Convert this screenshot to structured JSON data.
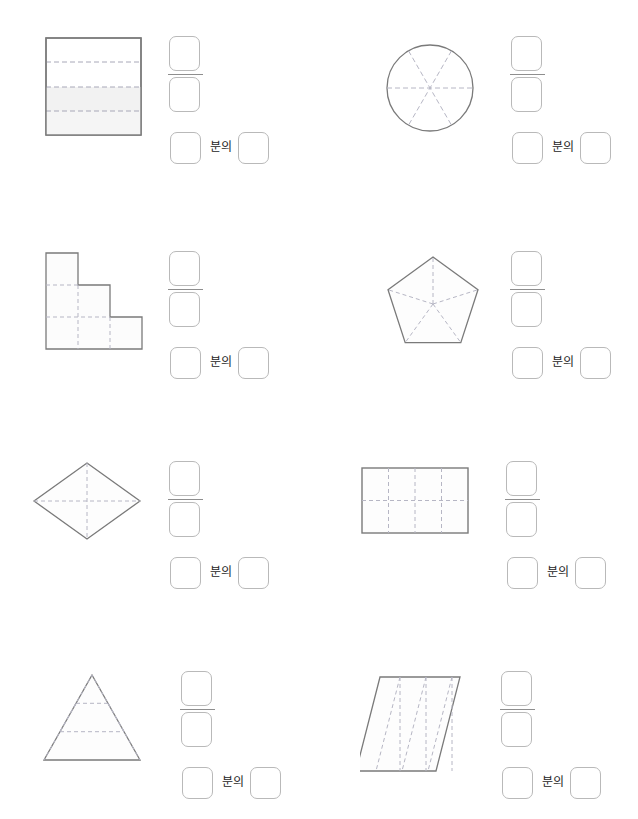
{
  "page": {
    "background": "#ffffff",
    "width": 638,
    "height": 819,
    "stroke_color": "#7a7a7a",
    "dash_color": "#b0b0b0",
    "box_border_color": "#b9b9b9",
    "shade_color": "#f2f2f2"
  },
  "labels": {
    "bunui": "분의"
  },
  "problems": [
    {
      "id": "p1",
      "index": 1,
      "figure": {
        "name": "rectangle-horizontal-strips",
        "shape": "rectangle",
        "total_parts": 4,
        "shaded_parts": 2,
        "division": "horizontal strips",
        "shaded_indices": [
          3,
          4
        ]
      },
      "answer": {
        "numerator": "",
        "denominator": "",
        "words_left": "",
        "words_right": "",
        "separator": "분의"
      }
    },
    {
      "id": "p2",
      "index": 2,
      "figure": {
        "name": "circle-six-sectors",
        "shape": "circle",
        "total_parts": 6,
        "shaded_parts": 0,
        "division": "three diameters",
        "shaded_indices": []
      },
      "answer": {
        "numerator": "",
        "denominator": "",
        "words_left": "",
        "words_right": "",
        "separator": "분의"
      }
    },
    {
      "id": "p3",
      "index": 3,
      "figure": {
        "name": "staircase-six-squares",
        "shape": "staircase polyomino",
        "total_parts": 6,
        "shaded_parts": 0,
        "division": "unit squares grid",
        "shaded_indices": []
      },
      "answer": {
        "numerator": "",
        "denominator": "",
        "words_left": "",
        "words_right": "",
        "separator": "분의"
      }
    },
    {
      "id": "p4",
      "index": 4,
      "figure": {
        "name": "pentagon-five-triangles",
        "shape": "pentagon",
        "total_parts": 5,
        "shaded_parts": 0,
        "division": "radii from center",
        "shaded_indices": []
      },
      "answer": {
        "numerator": "",
        "denominator": "",
        "words_left": "",
        "words_right": "",
        "separator": "분의"
      }
    },
    {
      "id": "p5",
      "index": 5,
      "figure": {
        "name": "rhombus-four-triangles",
        "shape": "rhombus",
        "total_parts": 4,
        "shaded_parts": 0,
        "division": "two diagonals",
        "shaded_indices": []
      },
      "answer": {
        "numerator": "",
        "denominator": "",
        "words_left": "",
        "words_right": "",
        "separator": "분의"
      }
    },
    {
      "id": "p6",
      "index": 6,
      "figure": {
        "name": "rectangle-grid-eight",
        "shape": "rectangle",
        "total_parts": 8,
        "shaded_parts": 0,
        "division": "4 columns by 2 rows",
        "shaded_indices": []
      },
      "answer": {
        "numerator": "",
        "denominator": "",
        "words_left": "",
        "words_right": "",
        "separator": "분의"
      }
    },
    {
      "id": "p7",
      "index": 7,
      "figure": {
        "name": "triangle-nine-triangles",
        "shape": "triangle",
        "total_parts": 9,
        "shaded_parts": 0,
        "division": "3 rows of small triangles",
        "shaded_indices": []
      },
      "answer": {
        "numerator": "",
        "denominator": "",
        "words_left": "",
        "words_right": "",
        "separator": "분의"
      }
    },
    {
      "id": "p8",
      "index": 8,
      "figure": {
        "name": "parallelogram-four-strips",
        "shape": "parallelogram",
        "total_parts": 4,
        "shaded_parts": 0,
        "division": "slanted strips",
        "shaded_indices": []
      },
      "answer": {
        "numerator": "",
        "denominator": "",
        "words_left": "",
        "words_right": "",
        "separator": "분의"
      }
    }
  ]
}
